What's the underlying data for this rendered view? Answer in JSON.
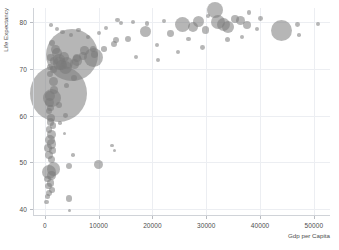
{
  "chart_data": {
    "type": "scatter",
    "title": "",
    "xlabel": "Gdp per Capita",
    "ylabel": "Life Expectancy",
    "xlim": [
      -2200,
      53000
    ],
    "ylim": [
      38.5,
      83.0
    ],
    "xticks": [
      0,
      10000,
      20000,
      30000,
      40000,
      50000
    ],
    "xticklabels": [
      "0",
      "10000",
      "20000",
      "30000",
      "40000",
      "50000"
    ],
    "yticks": [
      40,
      50,
      60,
      70,
      80
    ],
    "yticklabels": [
      "40",
      "50",
      "60",
      "70",
      "80"
    ],
    "grid": true,
    "legend": null,
    "marker_color": "#7a7a7a",
    "marker_opacity": 0.55,
    "size_encodes": "population",
    "points": [
      {
        "x": 2452,
        "y": 64.7,
        "r": 28.5
      },
      {
        "x": 4959,
        "y": 72.9,
        "r": 26.0
      },
      {
        "x": 9066,
        "y": 72.4,
        "r": 9.5
      },
      {
        "x": 1391,
        "y": 63.8,
        "r": 9.0
      },
      {
        "x": 44000,
        "y": 78.2,
        "r": 10.5
      },
      {
        "x": 31656,
        "y": 82.6,
        "r": 8.0
      },
      {
        "x": 25523,
        "y": 79.4,
        "r": 7.5
      },
      {
        "x": 32170,
        "y": 80.0,
        "r": 7.0
      },
      {
        "x": 33203,
        "y": 79.4,
        "r": 6.5
      },
      {
        "x": 34000,
        "y": 79.0,
        "r": 6.0
      },
      {
        "x": 28570,
        "y": 80.2,
        "r": 5.5
      },
      {
        "x": 27538,
        "y": 78.9,
        "r": 5.0
      },
      {
        "x": 36319,
        "y": 80.4,
        "r": 4.5
      },
      {
        "x": 37506,
        "y": 79.3,
        "r": 4.0
      },
      {
        "x": 35278,
        "y": 80.6,
        "r": 4.0
      },
      {
        "x": 29796,
        "y": 78.3,
        "r": 3.6
      },
      {
        "x": 23348,
        "y": 77.6,
        "r": 3.4
      },
      {
        "x": 18678,
        "y": 78.0,
        "r": 5.5
      },
      {
        "x": 15389,
        "y": 76.4,
        "r": 3.0
      },
      {
        "x": 13206,
        "y": 76.2,
        "r": 3.2
      },
      {
        "x": 12779,
        "y": 75.3,
        "r": 3.0
      },
      {
        "x": 10957,
        "y": 74.2,
        "r": 2.8
      },
      {
        "x": 9269,
        "y": 73.0,
        "r": 3.4
      },
      {
        "x": 8948,
        "y": 74.2,
        "r": 3.0
      },
      {
        "x": 7408,
        "y": 73.9,
        "r": 4.2
      },
      {
        "x": 7100,
        "y": 72.8,
        "r": 4.0
      },
      {
        "x": 6025,
        "y": 72.4,
        "r": 4.0
      },
      {
        "x": 5937,
        "y": 71.8,
        "r": 5.2
      },
      {
        "x": 5581,
        "y": 71.0,
        "r": 4.6
      },
      {
        "x": 4172,
        "y": 71.3,
        "r": 6.0
      },
      {
        "x": 3822,
        "y": 70.2,
        "r": 6.5
      },
      {
        "x": 3548,
        "y": 72.6,
        "r": 5.0
      },
      {
        "x": 3095,
        "y": 70.8,
        "r": 5.2
      },
      {
        "x": 2749,
        "y": 71.1,
        "r": 6.2
      },
      {
        "x": 2602,
        "y": 72.0,
        "r": 5.8
      },
      {
        "x": 2280,
        "y": 73.3,
        "r": 5.0
      },
      {
        "x": 2013,
        "y": 74.2,
        "r": 4.4
      },
      {
        "x": 1624,
        "y": 71.7,
        "r": 4.0
      },
      {
        "x": 1593,
        "y": 69.9,
        "r": 3.6
      },
      {
        "x": 1391,
        "y": 75.6,
        "r": 3.0
      },
      {
        "x": 1056,
        "y": 72.4,
        "r": 3.2
      },
      {
        "x": 982,
        "y": 70.3,
        "r": 3.0
      },
      {
        "x": 873,
        "y": 68.9,
        "r": 3.0
      },
      {
        "x": 1545,
        "y": 67.3,
        "r": 4.5
      },
      {
        "x": 1712,
        "y": 65.5,
        "r": 3.8
      },
      {
        "x": 1044,
        "y": 64.1,
        "r": 5.0
      },
      {
        "x": 930,
        "y": 62.7,
        "r": 4.6
      },
      {
        "x": 1107,
        "y": 61.6,
        "r": 3.4
      },
      {
        "x": 706,
        "y": 60.9,
        "r": 3.0
      },
      {
        "x": 1213,
        "y": 59.4,
        "r": 4.0
      },
      {
        "x": 1057,
        "y": 58.6,
        "r": 3.6
      },
      {
        "x": 1534,
        "y": 57.9,
        "r": 3.2
      },
      {
        "x": 760,
        "y": 57.0,
        "r": 3.4
      },
      {
        "x": 1271,
        "y": 56.0,
        "r": 4.4
      },
      {
        "x": 926,
        "y": 54.8,
        "r": 5.2
      },
      {
        "x": 1191,
        "y": 53.9,
        "r": 4.6
      },
      {
        "x": 619,
        "y": 53.1,
        "r": 3.8
      },
      {
        "x": 1441,
        "y": 52.5,
        "r": 3.2
      },
      {
        "x": 830,
        "y": 51.5,
        "r": 4.0
      },
      {
        "x": 1263,
        "y": 50.6,
        "r": 3.4
      },
      {
        "x": 9980,
        "y": 49.6,
        "r": 4.6
      },
      {
        "x": 4513,
        "y": 49.3,
        "r": 3.0
      },
      {
        "x": 1602,
        "y": 48.6,
        "r": 6.8
      },
      {
        "x": 795,
        "y": 47.9,
        "r": 7.2
      },
      {
        "x": 1264,
        "y": 47.2,
        "r": 4.2
      },
      {
        "x": 541,
        "y": 46.4,
        "r": 3.4
      },
      {
        "x": 1024,
        "y": 45.6,
        "r": 3.8
      },
      {
        "x": 706,
        "y": 44.9,
        "r": 3.2
      },
      {
        "x": 1327,
        "y": 44.1,
        "r": 2.8
      },
      {
        "x": 863,
        "y": 43.4,
        "r": 3.0
      },
      {
        "x": 430,
        "y": 42.7,
        "r": 2.6
      },
      {
        "x": 4500,
        "y": 42.3,
        "r": 3.4
      },
      {
        "x": 277,
        "y": 41.5,
        "r": 2.4
      },
      {
        "x": 12500,
        "y": 53.6,
        "r": 1.8
      },
      {
        "x": 12900,
        "y": 52.5,
        "r": 1.6
      },
      {
        "x": 5200,
        "y": 51.6,
        "r": 1.8
      },
      {
        "x": 3700,
        "y": 56.2,
        "r": 1.6
      },
      {
        "x": 2800,
        "y": 58.4,
        "r": 1.8
      },
      {
        "x": 4600,
        "y": 39.6,
        "r": 1.6
      },
      {
        "x": 47000,
        "y": 79.4,
        "r": 2.4
      },
      {
        "x": 50800,
        "y": 79.6,
        "r": 2.2
      },
      {
        "x": 47200,
        "y": 77.2,
        "r": 1.8
      },
      {
        "x": 40100,
        "y": 80.8,
        "r": 2.4
      },
      {
        "x": 39400,
        "y": 78.6,
        "r": 2.0
      },
      {
        "x": 38000,
        "y": 82.0,
        "r": 2.2
      },
      {
        "x": 30400,
        "y": 81.2,
        "r": 2.0
      },
      {
        "x": 26700,
        "y": 76.4,
        "r": 2.2
      },
      {
        "x": 22100,
        "y": 80.2,
        "r": 2.2
      },
      {
        "x": 20900,
        "y": 75.0,
        "r": 2.0
      },
      {
        "x": 19000,
        "y": 79.6,
        "r": 2.4
      },
      {
        "x": 16400,
        "y": 80.0,
        "r": 2.2
      },
      {
        "x": 14100,
        "y": 79.8,
        "r": 2.0
      },
      {
        "x": 13500,
        "y": 80.4,
        "r": 2.2
      },
      {
        "x": 11400,
        "y": 78.8,
        "r": 2.0
      },
      {
        "x": 10100,
        "y": 77.6,
        "r": 2.2
      },
      {
        "x": 8100,
        "y": 76.9,
        "r": 2.0
      },
      {
        "x": 6300,
        "y": 78.3,
        "r": 2.4
      },
      {
        "x": 4900,
        "y": 77.2,
        "r": 2.0
      },
      {
        "x": 3300,
        "y": 77.8,
        "r": 2.2
      },
      {
        "x": 2300,
        "y": 78.5,
        "r": 2.0
      },
      {
        "x": 1200,
        "y": 79.4,
        "r": 1.8
      },
      {
        "x": 33900,
        "y": 76.3,
        "r": 2.6
      },
      {
        "x": 36600,
        "y": 76.8,
        "r": 2.2
      },
      {
        "x": 29300,
        "y": 74.6,
        "r": 2.4
      },
      {
        "x": 24800,
        "y": 73.6,
        "r": 2.2
      },
      {
        "x": 21000,
        "y": 71.8,
        "r": 2.0
      },
      {
        "x": 16900,
        "y": 72.6,
        "r": 2.0
      },
      {
        "x": 5500,
        "y": 68.0,
        "r": 3.0
      },
      {
        "x": 4100,
        "y": 66.4,
        "r": 2.6
      },
      {
        "x": 2700,
        "y": 62.2,
        "r": 3.0
      },
      {
        "x": 3900,
        "y": 60.0,
        "r": 2.4
      }
    ]
  }
}
